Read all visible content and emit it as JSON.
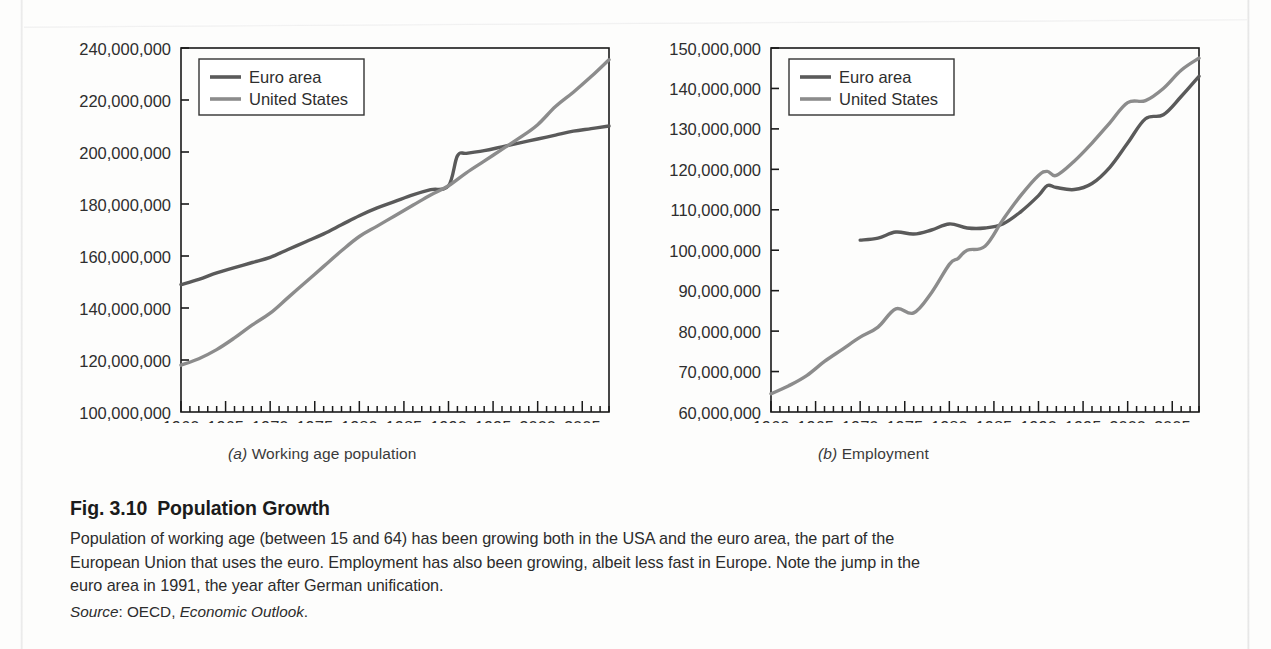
{
  "figure": {
    "title_number": "Fig. 3.10",
    "title_text": "Population Growth",
    "body_line1": "Population of working age (between 15 and 64) has been growing both in the USA and the euro area, the part of the",
    "body_line2": "European Union that uses the euro. Employment has also been growing, albeit less fast in Europe. Note the jump in the",
    "body_line3": "euro area in 1991, the year after German unification.",
    "source_label": "Source",
    "source_sep": ": ",
    "source_org": "OECD, ",
    "source_work": "Economic Outlook",
    "source_end": "."
  },
  "panels": {
    "a": {
      "tag": "(a)",
      "label": " Working age population"
    },
    "b": {
      "tag": "(b)",
      "label": " Employment"
    }
  },
  "colors": {
    "euro_area": "#5a5a5a",
    "united_states": "#8c8c8c",
    "axis": "#1a1a1a",
    "text": "#2c2c2c",
    "page": "#fdfdfc"
  },
  "chart_data": [
    {
      "type": "line",
      "id": "working-age-population",
      "title": "(a) Working age population",
      "xlabel": "",
      "ylabel": "",
      "xlim": [
        1960,
        2008
      ],
      "ylim": [
        100000000,
        240000000
      ],
      "ytick_step": 20000000,
      "xtick_step": 1,
      "grid": false,
      "legend_position": "top-left",
      "ytick_labels": [
        "100,000,000",
        "120,000,000",
        "140,000,000",
        "160,000,000",
        "180,000,000",
        "200,000,000",
        "220,000,000",
        "240,000,000"
      ],
      "xtick_labels": [
        "1960",
        "1965",
        "1970",
        "1975",
        "1980",
        "1985",
        "1990",
        "1995",
        "2000",
        "2005"
      ],
      "series": [
        {
          "name": "Euro area",
          "color": "#5a5a5a",
          "x": [
            1960,
            1962,
            1964,
            1966,
            1968,
            1970,
            1972,
            1974,
            1976,
            1978,
            1980,
            1982,
            1984,
            1986,
            1988,
            1990,
            1991,
            1992,
            1994,
            1996,
            1998,
            2000,
            2002,
            2004,
            2006,
            2008
          ],
          "values": [
            149000000,
            151000000,
            153500000,
            155500000,
            157500000,
            159500000,
            162500000,
            165500000,
            168500000,
            172000000,
            175500000,
            178500000,
            181000000,
            183500000,
            185500000,
            187000000,
            198500000,
            199500000,
            200500000,
            202000000,
            203500000,
            205000000,
            206500000,
            208000000,
            209000000,
            210000000
          ]
        },
        {
          "name": "United States",
          "color": "#8c8c8c",
          "x": [
            1960,
            1962,
            1964,
            1966,
            1968,
            1970,
            1972,
            1974,
            1976,
            1978,
            1980,
            1982,
            1984,
            1986,
            1988,
            1990,
            1992,
            1994,
            1996,
            1998,
            2000,
            2002,
            2004,
            2006,
            2008
          ],
          "values": [
            118000000,
            120500000,
            124000000,
            128500000,
            133500000,
            138000000,
            144000000,
            150000000,
            156000000,
            162000000,
            167500000,
            171500000,
            175500000,
            179500000,
            183500000,
            187000000,
            192000000,
            196500000,
            201000000,
            205500000,
            210500000,
            217500000,
            223000000,
            229000000,
            235500000
          ]
        }
      ]
    },
    {
      "type": "line",
      "id": "employment",
      "title": "(b) Employment",
      "xlabel": "",
      "ylabel": "",
      "xlim": [
        1960,
        2008
      ],
      "ylim": [
        60000000,
        150000000
      ],
      "ytick_step": 10000000,
      "xtick_step": 1,
      "grid": false,
      "legend_position": "top-left",
      "ytick_labels": [
        "60,000,000",
        "70,000,000",
        "80,000,000",
        "90,000,000",
        "100,000,000",
        "110,000,000",
        "120,000,000",
        "130,000,000",
        "140,000,000",
        "150,000,000"
      ],
      "xtick_labels": [
        "1960",
        "1965",
        "1970",
        "1975",
        "1980",
        "1985",
        "1990",
        "1995",
        "2000",
        "2005"
      ],
      "series": [
        {
          "name": "Euro area",
          "color": "#5a5a5a",
          "x": [
            1970,
            1972,
            1974,
            1976,
            1978,
            1980,
            1982,
            1984,
            1986,
            1988,
            1990,
            1991,
            1992,
            1994,
            1996,
            1998,
            2000,
            2002,
            2004,
            2006,
            2008
          ],
          "values": [
            102500000,
            103000000,
            104500000,
            104000000,
            105000000,
            106500000,
            105500000,
            105500000,
            106500000,
            109500000,
            113500000,
            116000000,
            115500000,
            115000000,
            116500000,
            120500000,
            126500000,
            132500000,
            133500000,
            138000000,
            143000000
          ]
        },
        {
          "name": "United States",
          "color": "#8c8c8c",
          "x": [
            1960,
            1962,
            1964,
            1966,
            1968,
            1970,
            1972,
            1974,
            1976,
            1978,
            1980,
            1981,
            1982,
            1984,
            1986,
            1988,
            1990,
            1991,
            1992,
            1994,
            1996,
            1998,
            2000,
            2002,
            2004,
            2006,
            2008
          ],
          "values": [
            64500000,
            66500000,
            69000000,
            72500000,
            75500000,
            78500000,
            81000000,
            85500000,
            84500000,
            89500000,
            96500000,
            98000000,
            100000000,
            101000000,
            107500000,
            113500000,
            118500000,
            119500000,
            118500000,
            122000000,
            126500000,
            131500000,
            136500000,
            137000000,
            140000000,
            144500000,
            147500000
          ]
        }
      ]
    }
  ]
}
